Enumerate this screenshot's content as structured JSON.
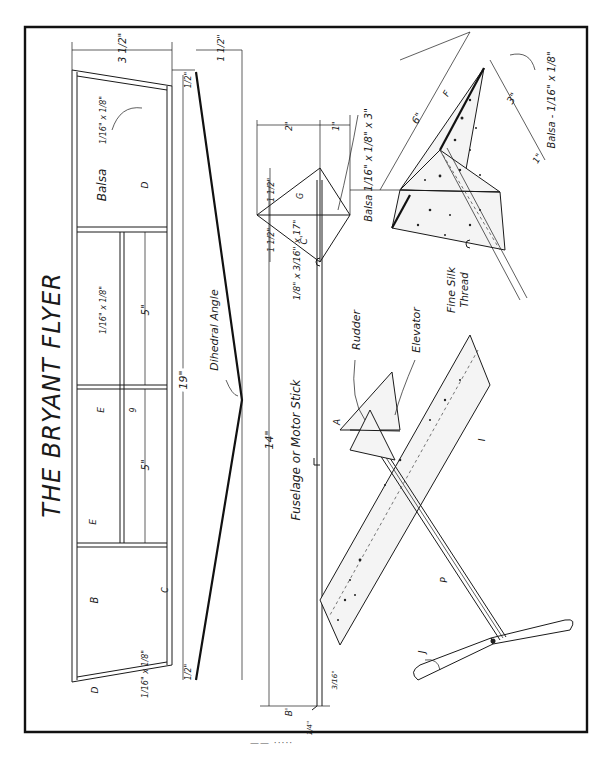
{
  "title": "THE BRYANT FLYER",
  "colors": {
    "ink": "#1a1a1a",
    "paper": "#ffffff",
    "silk_fill": "#f4f4f4"
  },
  "wing_plan": {
    "label_material": "Balsa",
    "spar_size": "1/16\" x 1/8\"",
    "rib_size": "1/16\" x 1/8\"",
    "tip_rib_size": "1/16\" x 1/8\"",
    "chord_dim": "3 1/2\"",
    "tip_offset_dim": "1/2\"",
    "tip_offset_dim_2": "1/2\"",
    "span_dim": "19\"",
    "section_dim_1": "5\"",
    "section_dim_2": "5\"",
    "part_labels": {
      "B": "B",
      "C": "C",
      "D_top": "D",
      "D_bottom": "D",
      "E_top": "E",
      "E_bottom": "E",
      "G": "9"
    }
  },
  "dihedral_view": {
    "label": "Dihedral Angle",
    "rise_dim": "1 1/2\""
  },
  "fuselage": {
    "label": "Fuselage or Motor Stick",
    "size": "1/8\" x 3/16\" x 17\"",
    "length_dim": "14\"",
    "part_A": "A",
    "part_B": "B'",
    "hook_dim": "3/16\"",
    "bearing_dim": "1/4\""
  },
  "tail_detail": {
    "width_dim_1": "2\"",
    "width_dim_2": "1\"",
    "half_span_1": "1 1/2\"",
    "half_span_2": "1 1/2\"",
    "part_G": "G",
    "part_C": "C'",
    "material": "Balsa 1/16\" x 1/8\" x 3\""
  },
  "tail_perspective": {
    "length_dim": "6\"",
    "height_dim": "3\"",
    "offset_dim": "1\"",
    "part_F": "F",
    "material": "Balsa - 1/16\" x 1/8\""
  },
  "assembly_labels": {
    "rudder": "Rudder",
    "elevator": "Elevator",
    "fine_silk": "Fine Silk",
    "thread": "Thread",
    "part_I": "I",
    "part_P": "P",
    "part_J": "J"
  },
  "footer": "—— ·····"
}
